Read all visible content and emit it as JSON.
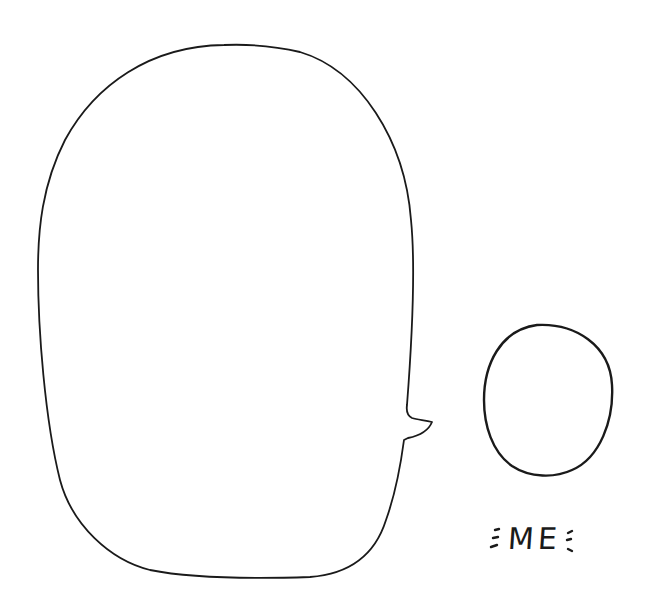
{
  "speech_bubble": {
    "text": ""
  },
  "character": {
    "label": "ME"
  },
  "colors": {
    "ink": "#1a1a1a",
    "background": "#ffffff"
  }
}
